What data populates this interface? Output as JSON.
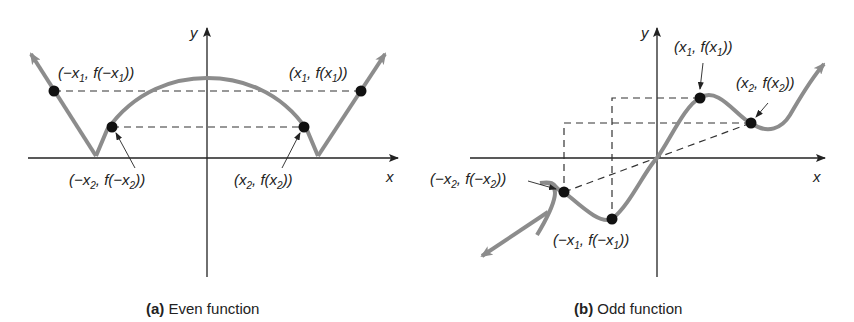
{
  "panels": [
    {
      "id": "a",
      "caption_letter": "(a)",
      "caption_text": " Even function",
      "axis_labels": {
        "x": "x",
        "y": "y"
      },
      "points": [
        {
          "name": "neg-x1",
          "label_main": "(−x",
          "sub": "1",
          "label_mid": ", f(−x",
          "sub2": "1",
          "label_end": "))"
        },
        {
          "name": "x1",
          "label_main": "(x",
          "sub": "1",
          "label_mid": ", f(x",
          "sub2": "1",
          "label_end": "))"
        },
        {
          "name": "neg-x2",
          "label_main": "(−x",
          "sub": "2",
          "label_mid": ", f(−x",
          "sub2": "2",
          "label_end": "))"
        },
        {
          "name": "x2",
          "label_main": "(x",
          "sub": "2",
          "label_mid": ", f(x",
          "sub2": "2",
          "label_end": "))"
        }
      ]
    },
    {
      "id": "b",
      "caption_letter": "(b)",
      "caption_text": " Odd function",
      "axis_labels": {
        "x": "x",
        "y": "y"
      },
      "points": [
        {
          "name": "x1",
          "label_main": "(x",
          "sub": "1",
          "label_mid": ", f(x",
          "sub2": "1",
          "label_end": "))"
        },
        {
          "name": "x2",
          "label_main": "(x",
          "sub": "2",
          "label_mid": ", f(x",
          "sub2": "2",
          "label_end": "))"
        },
        {
          "name": "neg-x2",
          "label_main": "(−x",
          "sub": "2",
          "label_mid": ", f(−x",
          "sub2": "2",
          "label_end": "))"
        },
        {
          "name": "neg-x1",
          "label_main": "(−x",
          "sub": "1",
          "label_mid": ", f(−x",
          "sub2": "1",
          "label_end": "))"
        }
      ]
    }
  ],
  "colors": {
    "curve": "#8c8c8c",
    "axis": "#222222",
    "point": "#111111",
    "dash": "#333333"
  }
}
